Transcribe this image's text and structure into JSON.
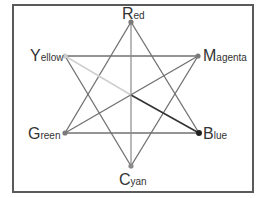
{
  "diagram": {
    "center": {
      "x": 131,
      "y": 95
    },
    "nodes": [
      {
        "id": "red",
        "initial": "R",
        "rest": "ed",
        "x": 131,
        "y": 22
      },
      {
        "id": "magenta",
        "initial": "M",
        "rest": "agenta",
        "x": 198,
        "y": 56
      },
      {
        "id": "blue",
        "initial": "B",
        "rest": "lue",
        "x": 199,
        "y": 133
      },
      {
        "id": "cyan",
        "initial": "C",
        "rest": "yan",
        "x": 131,
        "y": 166
      },
      {
        "id": "green",
        "initial": "G",
        "rest": "reen",
        "x": 65,
        "y": 133
      },
      {
        "id": "yellow",
        "initial": "Y",
        "rest": "ellow",
        "x": 65,
        "y": 56
      }
    ],
    "colors": {
      "frame": "#5a5a5a",
      "edge": "#707070",
      "node": "#7a7a7a",
      "blue_node": "#222222",
      "center_to_blue": "#333333",
      "center_to_yellow": "#cfcfcf",
      "center_vertical": "#8a8a8a"
    }
  }
}
